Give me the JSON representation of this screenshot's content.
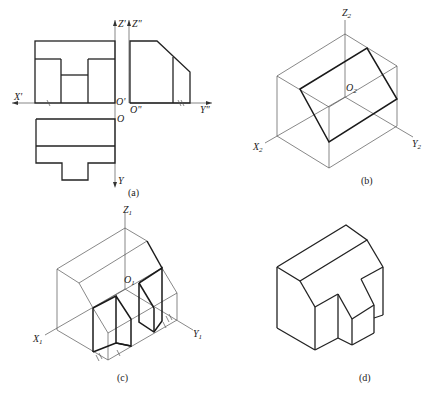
{
  "figure": {
    "panels": [
      {
        "id": "a",
        "caption": "(a)",
        "description": "Three-view orthographic projection",
        "axis_labels": {
          "z_front": "Z'",
          "z_side": "Z\"",
          "x_front": "X'",
          "origin_front": "O'",
          "origin_side": "O\"",
          "y_side": "Y\"",
          "origin_top": "O",
          "y_top": "Y"
        }
      },
      {
        "id": "b",
        "caption": "(b)",
        "description": "Isometric bounding box with inclined plane",
        "axis_labels": {
          "z": "Z",
          "z_sub": "2",
          "x": "X",
          "x_sub": "2",
          "y": "Y",
          "y_sub": "2",
          "origin": "O",
          "origin_sub": "2"
        }
      },
      {
        "id": "c",
        "caption": "(c)",
        "description": "Isometric construction with cut-outs",
        "axis_labels": {
          "z": "Z",
          "z_sub": "1",
          "x": "X",
          "x_sub": "1",
          "y": "Y",
          "y_sub": "1",
          "origin": "O",
          "origin_sub": "1"
        }
      },
      {
        "id": "d",
        "caption": "(d)",
        "description": "Finished isometric solid"
      }
    ]
  }
}
